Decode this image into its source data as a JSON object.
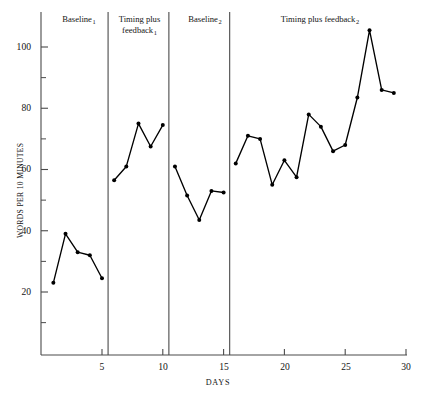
{
  "chart_data": {
    "type": "line",
    "title": "",
    "xlabel": "DAYS",
    "ylabel": "WORDS PER 10 MINUTES",
    "xlim": [
      0.4,
      30.2
    ],
    "ylim": [
      2,
      110
    ],
    "grid": false,
    "legend": "none",
    "x_ticks_major": [
      5,
      10,
      15,
      20,
      25,
      30
    ],
    "x_tick_labels": [
      "5",
      "10",
      "15",
      "20",
      "25",
      "30"
    ],
    "y_ticks_major": [
      20,
      40,
      60,
      80,
      100
    ],
    "y_tick_labels": [
      "20",
      "40",
      "60",
      "80",
      "100"
    ],
    "y_ticks_minor": [
      10,
      30,
      50,
      70,
      90
    ],
    "x": [
      1,
      2,
      3,
      4,
      5,
      6,
      7,
      8,
      9,
      10,
      11,
      12,
      13,
      14,
      15,
      16,
      17,
      18,
      19,
      20,
      21,
      22,
      23,
      24,
      25,
      26,
      27,
      28,
      29
    ],
    "values": [
      23,
      39,
      33,
      32,
      24.5,
      56.5,
      61,
      75,
      67.5,
      74.5,
      61,
      51.5,
      43.5,
      53,
      52.5,
      62,
      71,
      70,
      55,
      63,
      57.5,
      78,
      74,
      66,
      68,
      83.5,
      105.5,
      86,
      85
    ],
    "series": [
      {
        "name": "Words per 10 minutes",
        "marker": "filled-circle",
        "color": "#000000",
        "values": [
          23,
          39,
          33,
          32,
          24.5,
          56.5,
          61,
          75,
          67.5,
          74.5,
          61,
          51.5,
          43.5,
          53,
          52.5,
          62,
          71,
          70,
          55,
          63,
          57.5,
          78,
          74,
          66,
          68,
          83.5,
          105.5,
          86,
          85
        ]
      }
    ],
    "phases": [
      {
        "name": "Baseline",
        "subscript": "1",
        "x_start": 0.6,
        "x_end": 5.5,
        "label_lines": [
          "Baseline"
        ]
      },
      {
        "name": "Timing plus feedback",
        "subscript": "1",
        "x_start": 5.5,
        "x_end": 10.5,
        "label_lines": [
          "Timing plus",
          "feedback"
        ]
      },
      {
        "name": "Baseline",
        "subscript": "2",
        "x_start": 10.5,
        "x_end": 15.5,
        "label_lines": [
          "Baseline"
        ]
      },
      {
        "name": "Timing plus feedback",
        "subscript": "2",
        "x_start": 15.5,
        "x_end": 30.2,
        "label_lines": [
          "Timing plus feedback"
        ]
      }
    ],
    "phase_dividers": [
      5.5,
      10.5,
      15.5
    ],
    "segments_by_phase": [
      {
        "phase": "Baseline1",
        "x": [
          1,
          2,
          3,
          4,
          5
        ],
        "values": [
          23,
          39,
          33,
          32,
          24.5
        ]
      },
      {
        "phase": "TimingPlusFeedback1",
        "x": [
          6,
          7,
          8,
          9,
          10
        ],
        "values": [
          56.5,
          61,
          75,
          67.5,
          74.5
        ]
      },
      {
        "phase": "Baseline2",
        "x": [
          11,
          12,
          13,
          14,
          15
        ],
        "values": [
          61,
          51.5,
          43.5,
          53,
          52.5
        ]
      },
      {
        "phase": "TimingPlusFeedback2",
        "x": [
          16,
          17,
          18,
          19,
          20,
          21,
          22,
          23,
          24,
          25,
          26,
          27,
          28,
          29
        ],
        "values": [
          62,
          71,
          70,
          55,
          63,
          57.5,
          78,
          74,
          66,
          68,
          83.5,
          105.5,
          86,
          85
        ]
      }
    ]
  },
  "axes": {
    "y_title": "WORDS PER 10 MINUTES",
    "x_title": "DAYS"
  },
  "colors": {
    "line": "#000000",
    "axis": "#4a4a4a",
    "divider": "#4a4a4a",
    "text": "#141414",
    "background": "#ffffff"
  }
}
